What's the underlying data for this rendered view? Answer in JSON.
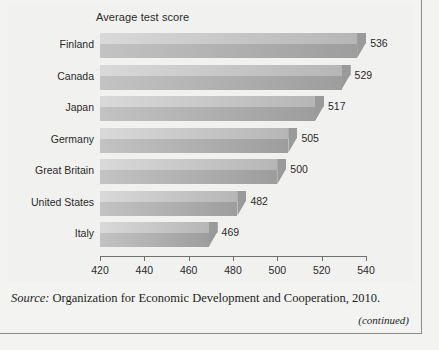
{
  "figure": {
    "source_prefix": "Source:",
    "source_text": "Organization for Economic Development and Cooperation, 2010.",
    "continued_note": "(continued)"
  },
  "chart_data": {
    "type": "bar",
    "orientation": "horizontal",
    "title": "Average test score",
    "xlabel": "",
    "ylabel": "",
    "xlim": [
      420,
      540
    ],
    "xticks": [
      420,
      440,
      460,
      480,
      500,
      520,
      540
    ],
    "grid": false,
    "legend": false,
    "categories": [
      "Finland",
      "Canada",
      "Japan",
      "Germany",
      "Great Britain",
      "United States",
      "Italy"
    ],
    "values": [
      536,
      529,
      517,
      505,
      500,
      482,
      469
    ],
    "value_labels": [
      "536",
      "529",
      "517",
      "505",
      "500",
      "482",
      "469"
    ],
    "colors": {
      "bar_top_light": "#d9d9d9",
      "bar_top_dark": "#b6b6b6",
      "bar_front_light": "#c3c3c3",
      "bar_front_dark": "#9d9d9d",
      "background": "#f1f1ef",
      "axis": "#6f6f6f",
      "text": "#2a2a2a",
      "frame": "#8d8d8d"
    }
  }
}
